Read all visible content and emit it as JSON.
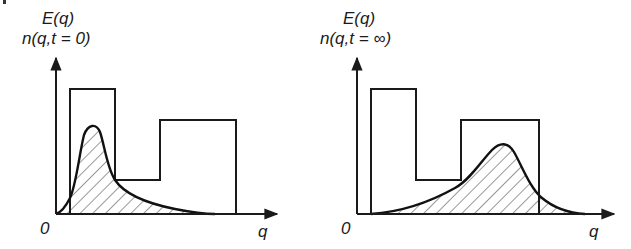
{
  "diagram": {
    "panels": [
      {
        "id": "initial",
        "y_label_line1": "E(q)",
        "y_label_line2": "n(q,t = 0)",
        "origin_label": "0",
        "x_label": "q",
        "curve_description": "narrow peak near low q, long decaying tail, hatched area",
        "energy_profile_description": "tall step, deep well, medium step"
      },
      {
        "id": "final",
        "y_label_line1": "E(q)",
        "y_label_line2": "n(q,t = ∞)",
        "origin_label": "0",
        "x_label": "q",
        "curve_description": "broad peak shifted to high q inside the second step, hatched area",
        "energy_profile_description": "tall step, deep well, medium step"
      }
    ],
    "colors": {
      "stroke": "#1a1a1a",
      "background": "#ffffff"
    }
  }
}
